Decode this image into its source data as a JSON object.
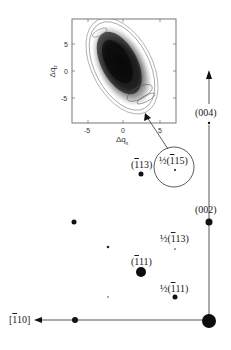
{
  "figure": {
    "type": "reciprocal-space-map-diagram",
    "colors": {
      "ink": "#1a1a1a",
      "contour_dark": "#111111",
      "axis": "#444444"
    }
  },
  "inset": {
    "x_axis_label": "Δq",
    "x_axis_sub": "x",
    "y_axis_label": "Δq",
    "y_axis_sub": "z",
    "x_ticks": [
      "-5",
      "0",
      "5"
    ],
    "y_ticks": [
      "5",
      "0",
      "-5"
    ],
    "xlim": [
      -8,
      8
    ],
    "ylim": [
      -9,
      9
    ],
    "content": "contour map of diffuse intensity, elongated ellipse tilted from upper-left to lower-right"
  },
  "axes": {
    "horizontal_label_pre": "[",
    "horizontal_label_bar": "1",
    "horizontal_label_post": "10]",
    "vertical_label": "(004)"
  },
  "labels": {
    "l002": "(002)",
    "l004": "(004)",
    "m113_pre": "(",
    "m113_bar": "1",
    "m113_post": "13)",
    "m111_pre": "(",
    "m111_bar": "1",
    "m111_post": "11)",
    "h115_pre": "½(",
    "h115_bar": "1",
    "h115_post": "15)",
    "h113_pre": "½(",
    "h113_bar": "1",
    "h113_post": "13)",
    "h111_pre": "½(",
    "h111_bar": "1",
    "h111_post": "11)"
  },
  "spots": [
    {
      "name": "origin-000",
      "x": 209,
      "y": 321,
      "r": 7
    },
    {
      "name": "spot-002",
      "x": 209,
      "y": 222,
      "r": 3.5
    },
    {
      "name": "spot-004",
      "x": 209,
      "y": 123,
      "r": 1.2
    },
    {
      "name": "spot-m110",
      "x": 75,
      "y": 320,
      "r": 3
    },
    {
      "name": "spot-m111",
      "x": 141,
      "y": 272,
      "r": 5
    },
    {
      "name": "spot-m113",
      "x": 141,
      "y": 174,
      "r": 2.5
    },
    {
      "name": "spot-half-m115",
      "x": 175,
      "y": 170,
      "r": 1
    },
    {
      "name": "spot-half-m113",
      "x": 175,
      "y": 249,
      "r": 0.8
    },
    {
      "name": "spot-half-m111",
      "x": 175,
      "y": 297,
      "r": 2.5
    },
    {
      "name": "spot-upper-left",
      "x": 74,
      "y": 222,
      "r": 2.5
    },
    {
      "name": "spot-mid-left",
      "x": 108,
      "y": 247,
      "r": 1.3
    },
    {
      "name": "spot-lower-left",
      "x": 108,
      "y": 297,
      "r": 0.8
    }
  ]
}
